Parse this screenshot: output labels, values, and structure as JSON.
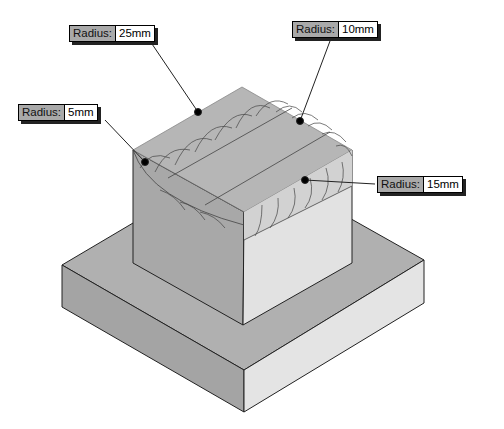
{
  "figure": {
    "callouts": [
      {
        "id": "r25",
        "label": "Radius:",
        "value": "25mm"
      },
      {
        "id": "r10",
        "label": "Radius:",
        "value": "10mm"
      },
      {
        "id": "r5",
        "label": "Radius:",
        "value": "5mm"
      },
      {
        "id": "r15",
        "label": "Radius:",
        "value": "15mm"
      }
    ]
  },
  "colors": {
    "top_face": "#b4b4b4",
    "left_face": "#a6a6a6",
    "right_face": "#e2e2e2",
    "edge": "#222222",
    "callout_label_bg": "#a9a9a9"
  }
}
